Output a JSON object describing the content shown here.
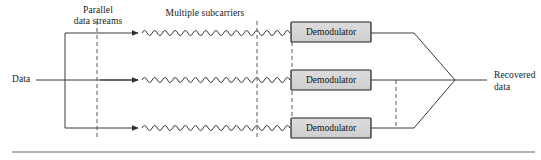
{
  "figure": {
    "type": "block-diagram",
    "background_color": "#ffffff",
    "line_color": "#3a3a3a",
    "text_color": "#1a1a1a",
    "box_fill_color": "#d4d4d4",
    "box_border_color": "#1f1f1f",
    "dash_color": "#5a5a5a"
  },
  "labels": {
    "input": "Data",
    "parallel_streams_line1": "Parallel",
    "parallel_streams_line2": "data streams",
    "subcarriers": "Multiple subcarriers",
    "output_line1": "Recovered",
    "output_line2": "data"
  },
  "blocks": [
    {
      "id": "demod-1",
      "label": "Demodulator",
      "x": 291,
      "y": 22,
      "width": 80,
      "height": 20
    },
    {
      "id": "demod-2",
      "label": "Demodulator",
      "x": 291,
      "y": 70,
      "width": 80,
      "height": 20
    },
    {
      "id": "demod-3",
      "label": "Demodulator",
      "x": 291,
      "y": 118,
      "width": 80,
      "height": 20
    }
  ],
  "branches": [
    {
      "id": "branch-top",
      "y": 33
    },
    {
      "id": "branch-middle",
      "y": 80
    },
    {
      "id": "branch-bottom",
      "y": 128
    }
  ],
  "waves": {
    "start_x": 138,
    "end_x": 291,
    "amplitude": 4,
    "cycles": 15,
    "description": "sinusoidal subcarrier waveform"
  },
  "dashed_guides": [
    {
      "id": "dash-parallel",
      "x": 97,
      "y1": 21,
      "y2": 140
    },
    {
      "id": "dash-subcarriers",
      "x": 257,
      "y1": 21,
      "y2": 140
    },
    {
      "id": "dash-demodulators",
      "x": 292,
      "y1": 42,
      "y2": 118
    },
    {
      "id": "dash-output",
      "x": 396,
      "y1": 80,
      "y2": 128
    }
  ],
  "combiner": {
    "apex_x": 455,
    "apex_y": 80,
    "output_end_x": 487
  },
  "footer_rule": {
    "y": 152,
    "x1": 12,
    "x2": 535
  }
}
